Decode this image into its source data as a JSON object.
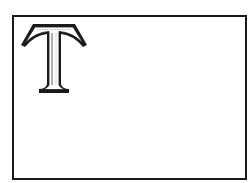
{
  "figure": {
    "letter": "T",
    "style": "outlined serif initial letter",
    "colors": {
      "stroke": "#1a1a1a",
      "fill": "#ffffff",
      "shade": "#cfcfcf",
      "frame": "#1a1a1a"
    }
  }
}
